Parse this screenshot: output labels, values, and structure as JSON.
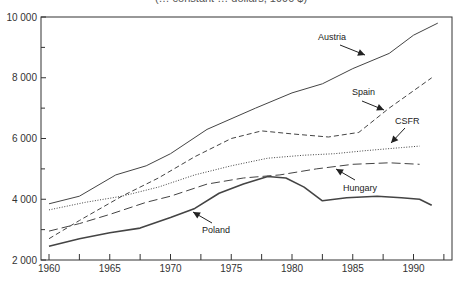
{
  "chart_data": {
    "type": "line",
    "title": "(… constant … dollars, 1990 $)",
    "xlabel": "",
    "ylabel": "",
    "xlim": [
      1959.5,
      1992.8
    ],
    "ylim": [
      2000,
      10000
    ],
    "x_ticks": [
      1960,
      1965,
      1970,
      1975,
      1980,
      1985,
      1990
    ],
    "x_tick_labels": [
      "1960",
      "1965",
      "1970",
      "1975",
      "1980",
      "1985",
      "1990"
    ],
    "x_minor_step": 2.5,
    "y_ticks": [
      2000,
      4000,
      6000,
      8000,
      10000
    ],
    "y_tick_labels": [
      "2 000",
      "4 000",
      "6 000",
      "8 000",
      "10 000"
    ],
    "y_minor_ticks": [
      3000,
      5000,
      7000,
      9000
    ],
    "grid": false,
    "legend": "inline labels with arrows",
    "series": [
      {
        "name": "Austria",
        "style": "solid-thin",
        "x": [
          1960,
          1962.5,
          1965.5,
          1968,
          1970,
          1973,
          1977,
          1980,
          1982.5,
          1985,
          1988,
          1990,
          1992
        ],
        "values": [
          3850,
          4100,
          4800,
          5100,
          5500,
          6300,
          7000,
          7500,
          7800,
          8300,
          8800,
          9400,
          9800
        ],
        "label_pos": [
          318,
          40
        ],
        "arrow": [
          [
            340,
            45
          ],
          [
            365,
            55
          ]
        ]
      },
      {
        "name": "Spain",
        "style": "dashed",
        "x": [
          1960,
          1962.5,
          1966,
          1969,
          1972,
          1975,
          1977.5,
          1980,
          1983,
          1985.5,
          1988,
          1991.5
        ],
        "values": [
          2700,
          3300,
          4100,
          4700,
          5400,
          6000,
          6250,
          6150,
          6050,
          6200,
          7000,
          8000
        ],
        "label_pos": [
          352,
          95
        ],
        "arrow": [
          [
            362,
            101
          ],
          [
            384,
            110
          ]
        ]
      },
      {
        "name": "CSFR",
        "style": "dotted",
        "x": [
          1960,
          1963,
          1966,
          1969,
          1972,
          1975,
          1978,
          1981,
          1983.5,
          1986,
          1989,
          1990.5
        ],
        "values": [
          3650,
          3900,
          4100,
          4400,
          4800,
          5100,
          5350,
          5450,
          5500,
          5600,
          5700,
          5750
        ],
        "label_pos": [
          395,
          124
        ],
        "arrow": [
          [
            405,
            128
          ],
          [
            391,
            143
          ]
        ]
      },
      {
        "name": "Hungary",
        "style": "long-dash",
        "x": [
          1960,
          1962.5,
          1965,
          1968,
          1970,
          1973,
          1976,
          1979,
          1982,
          1985,
          1988,
          1990.5
        ],
        "values": [
          2950,
          3200,
          3500,
          3900,
          4100,
          4500,
          4700,
          4800,
          5000,
          5150,
          5200,
          5150
        ],
        "label_pos": [
          343,
          191
        ],
        "arrow": [
          [
            355,
            180
          ],
          [
            336,
            169
          ]
        ]
      },
      {
        "name": "Poland",
        "style": "solid-thick",
        "x": [
          1960,
          1962.5,
          1965,
          1967.5,
          1970,
          1972,
          1974,
          1976,
          1978,
          1979.5,
          1981,
          1982.5,
          1984.5,
          1987,
          1989,
          1990.5,
          1991.5
        ],
        "values": [
          2450,
          2700,
          2900,
          3050,
          3400,
          3700,
          4200,
          4500,
          4750,
          4700,
          4400,
          3950,
          4050,
          4100,
          4050,
          4000,
          3800
        ],
        "label_pos": [
          202,
          233
        ],
        "arrow": [
          [
            212,
            223
          ],
          [
            193,
            212
          ]
        ]
      }
    ]
  },
  "colors": {
    "line": "#444444",
    "axis": "#333333",
    "text": "#222222",
    "background": "#ffffff"
  }
}
